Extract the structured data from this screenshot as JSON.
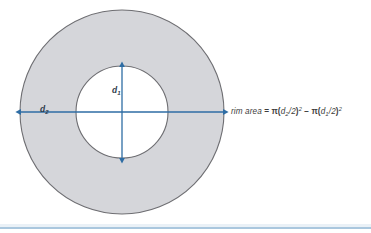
{
  "figure": {
    "name": "annulus-rim-area-diagram",
    "type": "geometry-diagram",
    "outer_circle": {
      "label": "d2",
      "label_text": "d",
      "label_subscript": "2",
      "fill_color": "#d5d6da",
      "stroke_color": "#6e6e72",
      "center_x": 122,
      "center_y": 112,
      "radius": 102
    },
    "inner_circle": {
      "label": "d1",
      "label_text": "d",
      "label_subscript": "1",
      "fill_color": "#ffffff",
      "stroke_color": "#6e6e72",
      "center_x": 122,
      "center_y": 112,
      "radius": 46
    },
    "dimension_lines": {
      "color": "#2e6da4",
      "horizontal": {
        "name": "outer-diameter-arrow",
        "x1": 20,
        "x2": 224,
        "y": 112
      },
      "vertical": {
        "name": "inner-diameter-arrow",
        "x": 122,
        "y1": 66,
        "y2": 159
      }
    },
    "formula": {
      "lhs": "rim area",
      "equals": "=",
      "term1_pi": "π",
      "term1_open": "(",
      "term1_var": "d",
      "term1_sub": "2",
      "term1_div": "/2",
      "term1_close": ")",
      "term1_exp": "2",
      "minus": "−",
      "term2_pi": "π",
      "term2_open": "(",
      "term2_var": "d",
      "term2_sub": "1",
      "term2_div": "/2",
      "term2_close": ")",
      "term2_exp": "2",
      "plain": "rim area = π(d2/2)² − π(d1/2)²"
    },
    "rule": {
      "name": "bottom-rule",
      "color": "#aac7de"
    }
  }
}
